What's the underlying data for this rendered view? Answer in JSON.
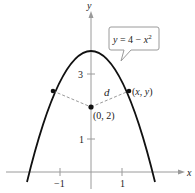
{
  "diagram": {
    "title": "",
    "axes": {
      "x_label": "x",
      "y_label": "y",
      "x_ticks": [
        {
          "value": -1,
          "label": "−1"
        },
        {
          "value": 1,
          "label": "1"
        }
      ],
      "y_ticks": [
        {
          "value": 1,
          "label": "1"
        },
        {
          "value": 3,
          "label": "3"
        }
      ],
      "axis_color": "#9a9a9a"
    },
    "curve": {
      "equation_label": "y = 4 − x²",
      "equation_parts": {
        "lhs": "y",
        "eq": " = 4 − ",
        "var": "x",
        "exp": "2"
      },
      "color": "#111111"
    },
    "points": {
      "center": {
        "label": "(0, 2)",
        "x": 0,
        "y": 2
      },
      "right": {
        "label": "(x, y)"
      },
      "left": {
        "label": ""
      }
    },
    "distance_label": "d",
    "dash_color": "#9a9a9a"
  }
}
